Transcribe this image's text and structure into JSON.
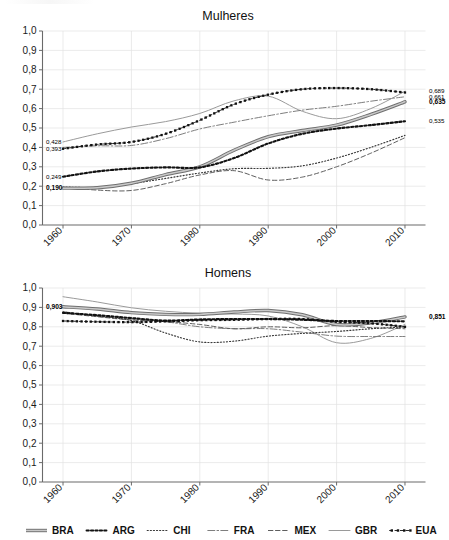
{
  "figure": {
    "width": 449,
    "height": 540,
    "background": "#ffffff"
  },
  "legend": {
    "position": "bottom",
    "items": [
      {
        "label": "BRA",
        "style": "thick-solid-gray",
        "color": "#7a7a7a"
      },
      {
        "label": "ARG",
        "style": "bold-dotted",
        "color": "#111111"
      },
      {
        "label": "CHI",
        "style": "fine-dotted",
        "color": "#3c3c3c"
      },
      {
        "label": "FRA",
        "style": "dash-dot",
        "color": "#6b6b6b"
      },
      {
        "label": "MEX",
        "style": "dashed",
        "color": "#555555"
      },
      {
        "label": "GBR",
        "style": "thin-solid",
        "color": "#8a8a8a"
      },
      {
        "label": "EUA",
        "style": "dot-dash-marker",
        "color": "#111111"
      }
    ]
  },
  "chart_data": [
    {
      "type": "line",
      "title": "Mulheres",
      "xlabel": "",
      "ylabel": "",
      "xlim": [
        1957,
        2013
      ],
      "ylim": [
        0.0,
        1.0
      ],
      "grid": true,
      "x": [
        1960,
        1965,
        1970,
        1975,
        1980,
        1985,
        1990,
        1995,
        2000,
        2005,
        2010
      ],
      "xticks": [
        "1960",
        "1970",
        "1980",
        "1990",
        "2000",
        "2010"
      ],
      "yticks": [
        "0,0",
        "0,1",
        "0,2",
        "0,3",
        "0,4",
        "0,5",
        "0,6",
        "0,7",
        "0,8",
        "0,9",
        "1,0"
      ],
      "series": [
        {
          "name": "BRA",
          "values": [
            0.19,
            0.192,
            0.215,
            0.26,
            0.3,
            0.385,
            0.455,
            0.487,
            0.515,
            0.57,
            0.635
          ]
        },
        {
          "name": "ARG",
          "values": [
            0.249,
            0.276,
            0.291,
            0.297,
            0.297,
            0.345,
            0.42,
            0.47,
            0.497,
            0.515,
            0.535
          ]
        },
        {
          "name": "CHI",
          "values": [
            0.196,
            0.194,
            0.213,
            0.24,
            0.268,
            0.29,
            0.292,
            0.305,
            0.345,
            0.4,
            0.462
          ]
        },
        {
          "name": "FRA",
          "values": [
            0.4,
            0.408,
            0.41,
            0.445,
            0.495,
            0.53,
            0.563,
            0.592,
            0.612,
            0.638,
            0.661
          ]
        },
        {
          "name": "MEX",
          "values": [
            0.195,
            0.18,
            0.178,
            0.213,
            0.258,
            0.28,
            0.232,
            0.247,
            0.3,
            0.37,
            0.45
          ]
        },
        {
          "name": "GBR",
          "values": [
            0.428,
            0.47,
            0.505,
            0.533,
            0.575,
            0.64,
            0.664,
            0.586,
            0.548,
            0.6,
            0.689
          ]
        },
        {
          "name": "EUA",
          "values": [
            0.393,
            0.415,
            0.428,
            0.47,
            0.54,
            0.622,
            0.672,
            0.7,
            0.706,
            0.7,
            0.683
          ]
        }
      ],
      "annotations": [
        {
          "text": "0,428",
          "value": 0.428,
          "series": "GBR",
          "side": "left",
          "bold": false
        },
        {
          "text": "0,393",
          "value": 0.393,
          "series": "EUA",
          "side": "left",
          "bold": false
        },
        {
          "text": "0,249",
          "value": 0.249,
          "series": "ARG",
          "side": "left",
          "bold": false
        },
        {
          "text": "0,190",
          "value": 0.19,
          "series": "BRA",
          "side": "left",
          "bold": true
        },
        {
          "text": "0,689",
          "value": 0.689,
          "series": "GBR",
          "side": "right",
          "bold": false
        },
        {
          "text": "0,661",
          "value": 0.661,
          "series": "FRA",
          "side": "right",
          "bold": false
        },
        {
          "text": "0,635",
          "value": 0.635,
          "series": "BRA",
          "side": "right",
          "bold": true
        },
        {
          "text": "0,535",
          "value": 0.535,
          "series": "ARG",
          "side": "right",
          "bold": false
        }
      ]
    },
    {
      "type": "line",
      "title": "Homens",
      "xlabel": "",
      "ylabel": "",
      "xlim": [
        1957,
        2013
      ],
      "ylim": [
        0.0,
        1.0
      ],
      "grid": true,
      "x": [
        1960,
        1965,
        1970,
        1975,
        1980,
        1985,
        1990,
        1995,
        2000,
        2005,
        2010
      ],
      "xticks": [
        "1960",
        "1970",
        "1980",
        "1990",
        "2000",
        "2010"
      ],
      "yticks": [
        "0,0",
        "0,1",
        "0,2",
        "0,3",
        "0,4",
        "0,5",
        "0,6",
        "0,7",
        "0,8",
        "0,9",
        "1,0"
      ],
      "series": [
        {
          "name": "BRA",
          "values": [
            0.903,
            0.892,
            0.873,
            0.864,
            0.864,
            0.876,
            0.884,
            0.862,
            0.812,
            0.82,
            0.851
          ]
        },
        {
          "name": "ARG",
          "values": [
            0.872,
            0.86,
            0.845,
            0.832,
            0.838,
            0.84,
            0.84,
            0.836,
            0.83,
            0.83,
            0.828
          ]
        },
        {
          "name": "CHI",
          "values": [
            0.876,
            0.855,
            0.832,
            0.768,
            0.722,
            0.726,
            0.752,
            0.766,
            0.776,
            0.79,
            0.8
          ]
        },
        {
          "name": "FRA",
          "values": [
            0.878,
            0.856,
            0.84,
            0.826,
            0.8,
            0.79,
            0.79,
            0.772,
            0.752,
            0.75,
            0.75
          ]
        },
        {
          "name": "MEX",
          "values": [
            0.87,
            0.852,
            0.835,
            0.827,
            0.812,
            0.79,
            0.8,
            0.795,
            0.806,
            0.796,
            0.79
          ]
        },
        {
          "name": "GBR",
          "values": [
            0.955,
            0.928,
            0.898,
            0.88,
            0.87,
            0.866,
            0.856,
            0.8,
            0.718,
            0.74,
            0.812
          ]
        },
        {
          "name": "EUA",
          "values": [
            0.83,
            0.826,
            0.824,
            0.828,
            0.834,
            0.836,
            0.84,
            0.84,
            0.826,
            0.818,
            0.8
          ]
        }
      ],
      "annotations": [
        {
          "text": "0,903",
          "value": 0.903,
          "series": "BRA",
          "side": "left",
          "bold": true
        },
        {
          "text": "0,851",
          "value": 0.851,
          "series": "BRA",
          "side": "right",
          "bold": true
        }
      ]
    }
  ]
}
